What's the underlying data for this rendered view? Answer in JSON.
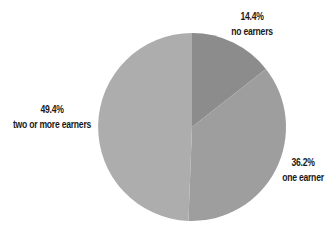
{
  "chart_data": {
    "type": "pie",
    "title": "",
    "categories": [
      "no earners",
      "one earner",
      "two or more earners"
    ],
    "values": [
      14.4,
      36.2,
      49.4
    ],
    "unit": "%",
    "labels": [
      {
        "pct": "14.4%",
        "name": "no earners"
      },
      {
        "pct": "36.2%",
        "name": "one earner"
      },
      {
        "pct": "49.4%",
        "name": "two or more earners"
      }
    ],
    "colors": [
      "#8c8c8c",
      "#9e9e9e",
      "#adadad"
    ],
    "start_angle_deg": -90,
    "direction": "clockwise",
    "legend": "none (direct labels)"
  }
}
